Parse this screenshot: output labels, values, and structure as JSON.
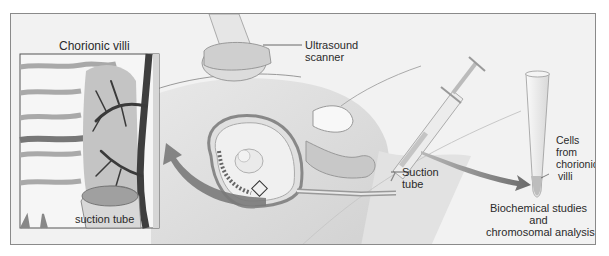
{
  "figure": {
    "labels": {
      "chorionic_villi": "Chorionic villi",
      "suction_tube_inset": "suction tube",
      "ultrasound_line1": "Ultrasound",
      "ultrasound_line2": "scanner",
      "suction_line1": "Suction",
      "suction_line2": "tube",
      "cells_line1": "Cells",
      "cells_line2": "from",
      "cells_line3": "chorionic",
      "cells_line4": "villi",
      "bio_line1": "Biochemical studies",
      "bio_line2": "and",
      "bio_line3": "chromosomal analysis"
    },
    "colors": {
      "background": "#f2f2f2",
      "frame": "#8a8a8a",
      "tissue_dark": "#555555",
      "tissue_mid": "#9a9a9a",
      "tissue_light": "#d9d9d9",
      "arrow": "#6e6e6e"
    }
  }
}
